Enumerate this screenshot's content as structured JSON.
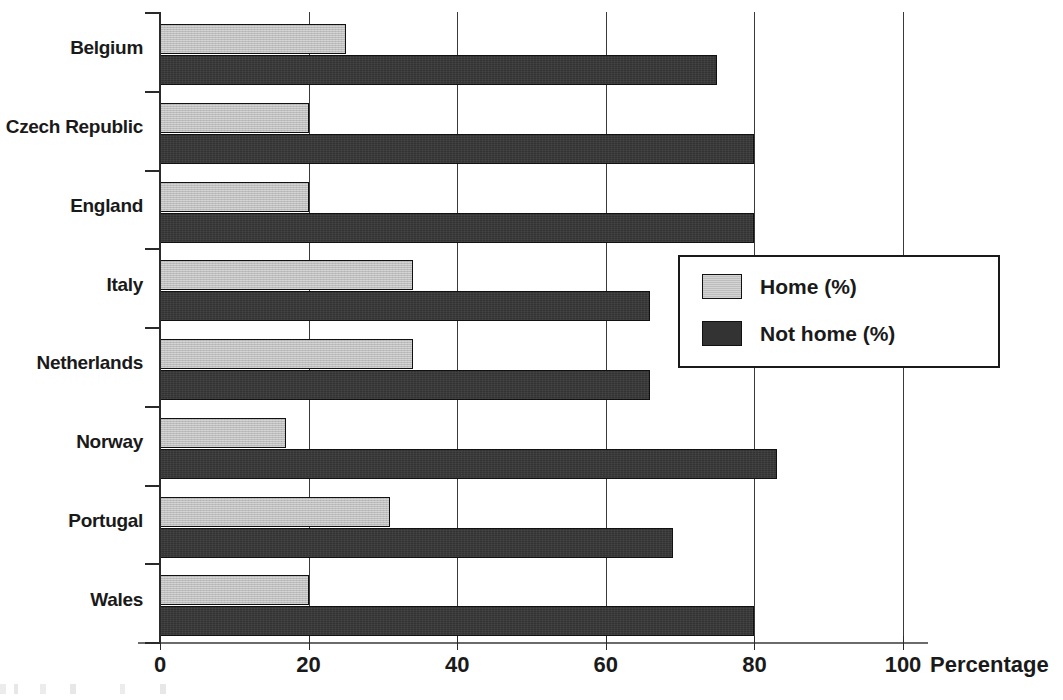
{
  "chart_data": {
    "type": "bar",
    "orientation": "horizontal",
    "title": "",
    "xlabel": "Percentage",
    "ylabel": "",
    "xlim": [
      0,
      100
    ],
    "xticks": [
      0,
      20,
      40,
      60,
      80,
      100
    ],
    "grid": true,
    "legend_position": "center-right",
    "categories": [
      "Belgium",
      "Czech Republic",
      "England",
      "Italy",
      "Netherlands",
      "Norway",
      "Portugal",
      "Wales"
    ],
    "series": [
      {
        "name": "Home (%)",
        "color": "#bdbdbd",
        "values": [
          25,
          20,
          20,
          34,
          34,
          17,
          31,
          20
        ]
      },
      {
        "name": "Not home (%)",
        "color": "#333333",
        "values": [
          75,
          80,
          80,
          66,
          66,
          83,
          69,
          80
        ]
      }
    ]
  },
  "axis": {
    "x_title": "Percentage",
    "tick_labels": [
      "0",
      "20",
      "40",
      "60",
      "80",
      "100"
    ]
  },
  "legend": {
    "items": [
      {
        "label": "Home (%)",
        "swatch": "light-gray"
      },
      {
        "label": "Not home (%)",
        "swatch": "dark-gray"
      }
    ]
  },
  "colors": {
    "home": "#bdbdbd",
    "not_home": "#333333",
    "axis": "#2a2a2a",
    "grid": "#3a3a3a",
    "background": "#ffffff"
  }
}
